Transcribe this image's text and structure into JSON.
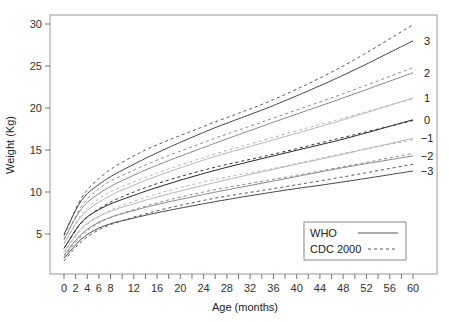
{
  "chart_data": {
    "type": "line",
    "title": "",
    "xlabel": "Age (months)",
    "ylabel": "Weight (Kg)",
    "xlim": [
      0,
      60
    ],
    "ylim": [
      0,
      30
    ],
    "grid": false,
    "legend_position": "lower-right (inside)",
    "x_ticks": [
      0,
      2,
      4,
      6,
      8,
      12,
      16,
      20,
      24,
      28,
      32,
      36,
      40,
      44,
      48,
      52,
      56,
      60
    ],
    "x_minor_ticks": [
      10,
      14,
      18,
      22,
      26,
      30,
      34,
      38,
      42,
      46,
      50,
      54,
      58
    ],
    "y_ticks": [
      5,
      10,
      15,
      20,
      25,
      30
    ],
    "legend": [
      {
        "name": "WHO",
        "style": "solid"
      },
      {
        "name": "CDC 2000",
        "style": "dashed"
      }
    ],
    "x": [
      0,
      3,
      6,
      12,
      24,
      36,
      48,
      60
    ],
    "series": [
      {
        "name": "WHO",
        "z": "3",
        "color": "#444444",
        "values": [
          5.0,
          9.0,
          10.9,
          13.3,
          17.1,
          20.3,
          23.9,
          28.0
        ]
      },
      {
        "name": "WHO",
        "z": "2",
        "color": "#888888",
        "values": [
          4.4,
          8.0,
          9.8,
          12.0,
          15.3,
          18.3,
          21.2,
          24.2
        ]
      },
      {
        "name": "WHO",
        "z": "1",
        "color": "#b5b5b5",
        "values": [
          3.9,
          7.1,
          8.8,
          10.8,
          13.8,
          16.2,
          18.6,
          21.2
        ]
      },
      {
        "name": "WHO",
        "z": "0",
        "color": "#222222",
        "values": [
          3.3,
          6.4,
          7.9,
          9.6,
          12.2,
          14.3,
          16.3,
          18.6
        ]
      },
      {
        "name": "WHO",
        "z": "-1",
        "color": "#b5b5b5",
        "values": [
          2.9,
          5.7,
          7.1,
          8.6,
          10.8,
          12.7,
          14.5,
          16.4
        ]
      },
      {
        "name": "WHO",
        "z": "-2",
        "color": "#888888",
        "values": [
          2.5,
          5.0,
          6.4,
          7.8,
          9.7,
          11.3,
          12.9,
          14.3
        ]
      },
      {
        "name": "WHO",
        "z": "-3",
        "color": "#444444",
        "values": [
          2.1,
          4.4,
          5.7,
          6.9,
          8.6,
          10.0,
          11.2,
          12.5
        ]
      },
      {
        "name": "CDC 2000",
        "z": "3",
        "color": "#555555",
        "values": [
          4.8,
          9.3,
          11.6,
          14.3,
          17.8,
          21.0,
          25.0,
          29.9
        ]
      },
      {
        "name": "CDC 2000",
        "z": "2",
        "color": "#888888",
        "values": [
          4.3,
          8.3,
          10.4,
          12.6,
          15.9,
          18.8,
          21.7,
          24.8
        ]
      },
      {
        "name": "CDC 2000",
        "z": "1",
        "color": "#b5b5b5",
        "values": [
          3.8,
          7.3,
          9.2,
          11.2,
          14.1,
          16.5,
          18.8,
          21.1
        ]
      },
      {
        "name": "CDC 2000",
        "z": "0",
        "color": "#333333",
        "values": [
          3.3,
          6.3,
          8.0,
          10.0,
          12.6,
          14.5,
          16.5,
          18.5
        ]
      },
      {
        "name": "CDC 2000",
        "z": "-1",
        "color": "#b5b5b5",
        "values": [
          2.8,
          5.5,
          7.1,
          8.9,
          11.2,
          12.8,
          14.6,
          16.2
        ]
      },
      {
        "name": "CDC 2000",
        "z": "-2",
        "color": "#888888",
        "values": [
          2.3,
          4.8,
          6.3,
          7.9,
          10.0,
          11.5,
          13.0,
          14.6
        ]
      },
      {
        "name": "CDC 2000",
        "z": "-3",
        "color": "#555555",
        "values": [
          1.8,
          4.1,
          5.5,
          7.0,
          9.0,
          10.4,
          11.8,
          13.3
        ]
      }
    ],
    "z_labels": [
      "3",
      "2",
      "1",
      "0",
      "−1",
      "−2",
      "−3"
    ]
  },
  "layout": {
    "plot_left": 50,
    "plot_top": 15,
    "plot_right": 437,
    "plot_bottom": 274,
    "x0_px": 64,
    "x60_px": 413,
    "y30_px": 24,
    "y5_px": 234
  }
}
